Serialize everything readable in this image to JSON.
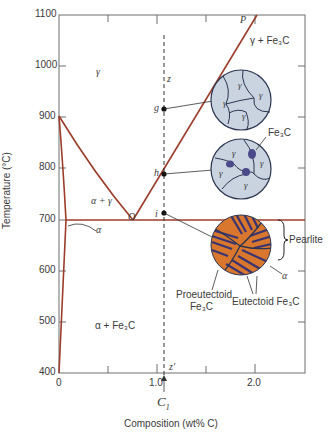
{
  "figure": {
    "type": "phase-diagram"
  },
  "axes": {
    "xlabel": "Composition (wt% C)",
    "ylabel": "Temperature (°C)",
    "x_ticks": [
      "0",
      "1.0",
      "2.0"
    ],
    "y_ticks": [
      "400",
      "500",
      "600",
      "700",
      "800",
      "900",
      "1000",
      "1100"
    ],
    "xlim": [
      0,
      2.5
    ],
    "ylim": [
      400,
      1100
    ]
  },
  "phase_labels": {
    "gamma": "γ",
    "gamma_fe3c": "γ + Fe₃C",
    "alpha_gamma": "α + γ",
    "alpha": "α",
    "alpha_fe3c": "α + Fe₃C"
  },
  "points": {
    "P": "P",
    "O": "O",
    "g": "g",
    "h": "h",
    "i": "i",
    "z": "z",
    "z_prime": "z′"
  },
  "composition_marker": {
    "label": "C",
    "subscript": "1"
  },
  "microstructure_labels": {
    "gamma": "γ",
    "fe3c": "Fe₃C",
    "pearlite": "Pearlite",
    "alpha": "α",
    "proeutectoid_line1": "Proeutectoid",
    "proeutectoid_line2": "Fe₃C",
    "eutectoid": "Eutectoid Fe₃C"
  },
  "colors": {
    "phase_line": "#9b3d2a",
    "axis": "#6e6e6e",
    "grain_fill": "#c9d4e0",
    "grain_line": "#2c3550",
    "cementite": "#4a4a8a",
    "pearlite_orange": "#d9772f",
    "pearlite_dark": "#3a3570"
  }
}
